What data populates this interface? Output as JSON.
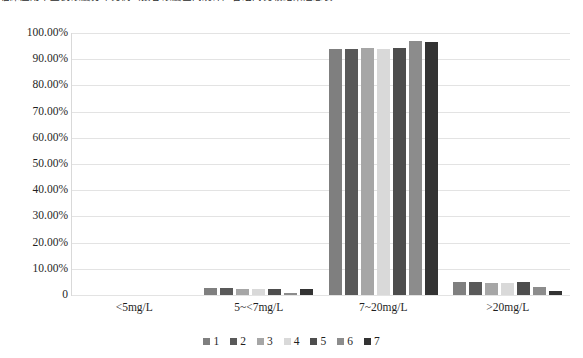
{
  "top_caption": {
    "text": "临床应用中血药浓度分布比例（按谷浓度区间统计）各组间比较结果汇总表"
  },
  "chart_data": {
    "type": "bar",
    "title": "",
    "subtitle": "",
    "xlabel": "",
    "ylabel": "",
    "categories": [
      "<5mg/L",
      "5~<7mg/L",
      "7~20mg/L",
      ">20mg/L"
    ],
    "series": [
      {
        "name": "1",
        "color": "#7f7f7f",
        "values": [
          0.0,
          2.5,
          94.0,
          4.8
        ]
      },
      {
        "name": "2",
        "color": "#595959",
        "values": [
          0.0,
          2.5,
          94.0,
          5.0
        ]
      },
      {
        "name": "3",
        "color": "#a6a6a6",
        "values": [
          0.0,
          2.4,
          94.2,
          4.6
        ]
      },
      {
        "name": "4",
        "color": "#d9d9d9",
        "values": [
          0.0,
          2.2,
          94.0,
          4.5
        ]
      },
      {
        "name": "5",
        "color": "#4d4d4d",
        "values": [
          0.0,
          2.3,
          94.3,
          5.0
        ]
      },
      {
        "name": "6",
        "color": "#8c8c8c",
        "values": [
          0.0,
          0.6,
          96.8,
          3.0
        ]
      },
      {
        "name": "7",
        "color": "#333333",
        "values": [
          0.0,
          2.4,
          96.6,
          1.6
        ]
      }
    ],
    "ylim": [
      0,
      100
    ],
    "yticks": [
      0,
      10,
      20,
      30,
      40,
      50,
      60,
      70,
      80,
      90,
      100
    ],
    "ytick_labels": [
      "0",
      "10.00%",
      "20.00%",
      "30.00%",
      "40.00%",
      "50.00%",
      "60.00%",
      "70.00%",
      "80.00%",
      "90.00%",
      "100.00%"
    ],
    "grid": true,
    "legend_position": "bottom",
    "legend_entries": [
      "1",
      "2",
      "3",
      "4",
      "5",
      "6",
      "7"
    ]
  },
  "colors": {
    "gridline": "#e3e3e3",
    "axis": "#d9d9d9",
    "text": "#1f1f1f",
    "background": "#ffffff"
  }
}
